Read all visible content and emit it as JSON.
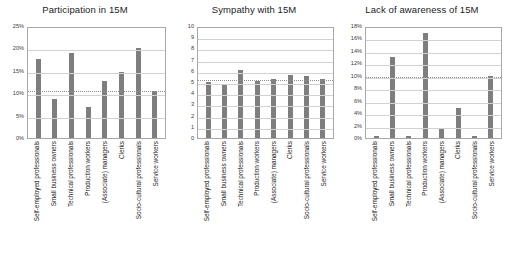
{
  "figure": {
    "background": "#ffffff",
    "bar_color": "#7e7e7e",
    "reference_line_color": "#8d8d8d",
    "grid_color": "#d2d2d2",
    "axis_color": "#a8a8a8"
  },
  "categories": [
    "Self-employed professionals",
    "Small business owners",
    "Technical professionals",
    "Production workers",
    "(Associate) managers",
    "Clerks",
    "Socio-cultural professionals",
    "Service workers"
  ],
  "chart_data": [
    {
      "type": "bar",
      "title": "Participation in 15M",
      "xlabel": "",
      "ylabel": "",
      "ylim": [
        0,
        25
      ],
      "yticks": [
        0,
        5,
        10,
        15,
        20,
        25
      ],
      "ytick_labels": [
        "0%",
        "5%",
        "10%",
        "15%",
        "20%",
        "25%"
      ],
      "grid": true,
      "legend": "none",
      "categories": [
        "Self-employed professionals",
        "Small business owners",
        "Technical professionals",
        "Production workers",
        "(Associate) managers",
        "Clerks",
        "Socio-cultural professionals",
        "Service workers"
      ],
      "values": [
        17.7,
        8.7,
        19.0,
        7.0,
        12.8,
        14.8,
        20.0,
        10.5
      ],
      "reference_line": {
        "value": 10.9,
        "style": "dotted",
        "label": ""
      }
    },
    {
      "type": "bar",
      "title": "Sympathy with 15M",
      "xlabel": "",
      "ylabel": "",
      "ylim": [
        0,
        10
      ],
      "yticks": [
        0,
        1,
        2,
        3,
        4,
        5,
        6,
        7,
        8,
        9,
        10
      ],
      "ytick_labels": [
        "0",
        "1",
        "2",
        "3",
        "4",
        "5",
        "6",
        "7",
        "8",
        "9",
        "10"
      ],
      "grid": true,
      "legend": "none",
      "categories": [
        "Self-employed professionals",
        "Small business owners",
        "Technical professionals",
        "Production workers",
        "(Associate) managers",
        "Clerks",
        "Socio-cultural professionals",
        "Service workers"
      ],
      "values": [
        5.0,
        4.8,
        6.1,
        5.1,
        5.3,
        5.6,
        5.5,
        5.3
      ],
      "reference_line": {
        "value": 5.4,
        "style": "dotted",
        "label": ""
      }
    },
    {
      "type": "bar",
      "title": "Lack of awareness of 15M",
      "xlabel": "",
      "ylabel": "",
      "ylim": [
        0,
        18
      ],
      "yticks": [
        0,
        2,
        4,
        6,
        8,
        10,
        12,
        14,
        16,
        18
      ],
      "ytick_labels": [
        "0%",
        "2%",
        "4%",
        "6%",
        "8%",
        "10%",
        "12%",
        "14%",
        "16%",
        "18%"
      ],
      "grid": true,
      "legend": "none",
      "categories": [
        "Self-employed professionals",
        "Small business owners",
        "Technical professionals",
        "Production workers",
        "(Associate) managers",
        "Clerks",
        "Socio-cultural professionals",
        "Service workers"
      ],
      "values": [
        0.3,
        13.0,
        0.3,
        16.8,
        1.6,
        4.9,
        0.3,
        10.0
      ],
      "reference_line": {
        "value": 10.1,
        "style": "dotted",
        "label": ""
      }
    }
  ]
}
